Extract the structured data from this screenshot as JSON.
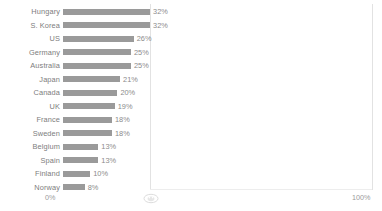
{
  "chart_data": {
    "type": "bar",
    "orientation": "horizontal",
    "title": "",
    "xlabel": "",
    "ylabel": "",
    "xlim": [
      0,
      100
    ],
    "grid": false,
    "legend": null,
    "axis": {
      "min_tick_label": "0%",
      "max_tick_label": "100%",
      "marker_icon": "oval-marker-icon"
    },
    "bar_color": "#9a9a9a",
    "label_color": "#7d7d7d",
    "value_suffix": "%",
    "categories": [
      "Hungary",
      "S. Korea",
      "US",
      "Germany",
      "Australia",
      "Japan",
      "Canada",
      "UK",
      "France",
      "Sweden",
      "Belgium",
      "Spain",
      "Finland",
      "Norway"
    ],
    "values": [
      32,
      32,
      26,
      25,
      25,
      21,
      20,
      19,
      18,
      18,
      13,
      13,
      10,
      8
    ],
    "value_labels": [
      "32%",
      "32%",
      "26%",
      "25%",
      "25%",
      "21%",
      "20%",
      "19%",
      "18%",
      "18%",
      "13%",
      "13%",
      "10%",
      "8%"
    ],
    "rows": [
      {
        "category": "Hungary",
        "value": 32,
        "value_label": "32%"
      },
      {
        "category": "S. Korea",
        "value": 32,
        "value_label": "32%"
      },
      {
        "category": "US",
        "value": 26,
        "value_label": "26%"
      },
      {
        "category": "Germany",
        "value": 25,
        "value_label": "25%"
      },
      {
        "category": "Australia",
        "value": 25,
        "value_label": "25%"
      },
      {
        "category": "Japan",
        "value": 21,
        "value_label": "21%"
      },
      {
        "category": "Canada",
        "value": 20,
        "value_label": "20%"
      },
      {
        "category": "UK",
        "value": 19,
        "value_label": "19%"
      },
      {
        "category": "France",
        "value": 18,
        "value_label": "18%"
      },
      {
        "category": "Sweden",
        "value": 18,
        "value_label": "18%"
      },
      {
        "category": "Belgium",
        "value": 13,
        "value_label": "13%"
      },
      {
        "category": "Spain",
        "value": 13,
        "value_label": "13%"
      },
      {
        "category": "Finland",
        "value": 10,
        "value_label": "10%"
      },
      {
        "category": "Norway",
        "value": 8,
        "value_label": "8%"
      }
    ]
  }
}
